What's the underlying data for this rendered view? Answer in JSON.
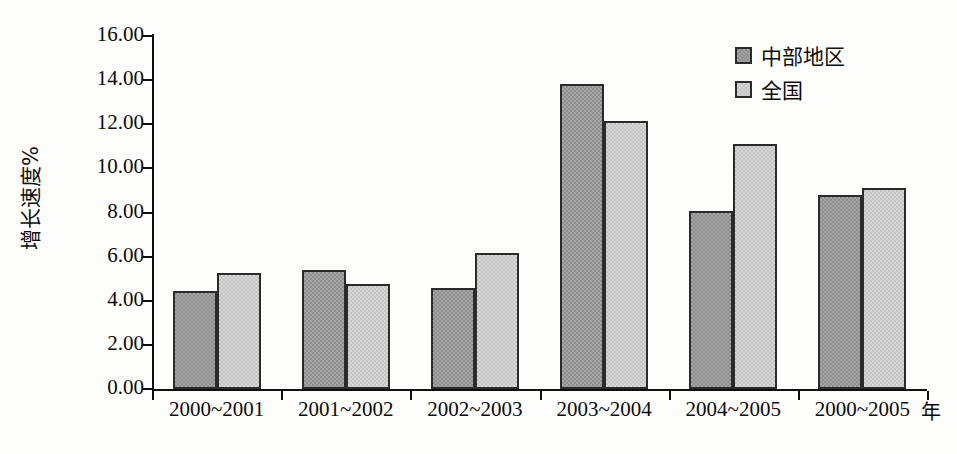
{
  "chart_data": {
    "type": "bar",
    "title": "",
    "subtitle": "",
    "xlabel": "年",
    "ylabel": "增长速度%",
    "categories": [
      "2000~2001",
      "2001~2002",
      "2002~2003",
      "2003~2004",
      "2004~2005",
      "2000~2005"
    ],
    "series": [
      {
        "name": "中部地区",
        "color": "#8e8e8e",
        "values": [
          4.35,
          5.3,
          4.5,
          13.75,
          8.0,
          8.7
        ]
      },
      {
        "name": "全国",
        "color": "#c4c4c4",
        "values": [
          5.17,
          4.67,
          6.07,
          12.08,
          11.0,
          9.0
        ]
      }
    ],
    "ylim": [
      0,
      16
    ],
    "ytick_step": 2,
    "ytick_labels": [
      "0.00",
      "2.00",
      "4.00",
      "6.00",
      "8.00",
      "10.00",
      "12.00",
      "14.00",
      "16.00"
    ],
    "grid": false,
    "legend_position": "top-right",
    "axis_color": "#0f0f0f",
    "bar_border_color": "#2b2b2b",
    "background": "#fdfdfc"
  },
  "legend": {
    "items": [
      {
        "label": "中部地区"
      },
      {
        "label": "全国"
      }
    ]
  },
  "axes": {
    "y_title": "增长速度%",
    "x_unit": "年"
  }
}
